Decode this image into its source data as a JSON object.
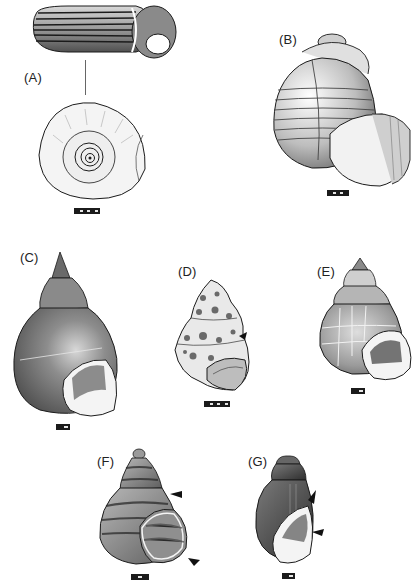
{
  "figure": {
    "type": "illustrated plate of gastropod shells",
    "panels": [
      {
        "id": "A",
        "label": "(A)",
        "views": [
          "lateral tube view with spiral stripes",
          "apical view showing coiled spire"
        ],
        "scale_bar_segments": 6
      },
      {
        "id": "B",
        "label": "(B)",
        "views": [
          "globose shell with spiral banding, aperture view"
        ],
        "scale_bar_segments": 5
      },
      {
        "id": "C",
        "label": "(C)",
        "views": [
          "elongate conical shell, aperture view"
        ],
        "scale_bar_segments": 2
      },
      {
        "id": "D",
        "label": "(D)",
        "views": [
          "sculptured eroded shell, aperture view"
        ],
        "scale_bar_segments": 6,
        "arrowheads": 1
      },
      {
        "id": "E",
        "label": "(E)",
        "views": [
          "conical shell with growth lines, aperture view"
        ],
        "scale_bar_segments": 2
      },
      {
        "id": "F",
        "label": "(F)",
        "views": [
          "banded conical shell, aperture view"
        ],
        "scale_bar_segments": 3,
        "arrowheads": 2
      },
      {
        "id": "G",
        "label": "(G)",
        "views": [
          "ovate dark shell, aperture view"
        ],
        "scale_bar_segments": 2,
        "arrowheads": 2
      }
    ],
    "colors": {
      "ink": "#1b1b1b",
      "shade": "#6f6f6f",
      "paper": "#ffffff",
      "light": "#e9e9e9"
    }
  }
}
